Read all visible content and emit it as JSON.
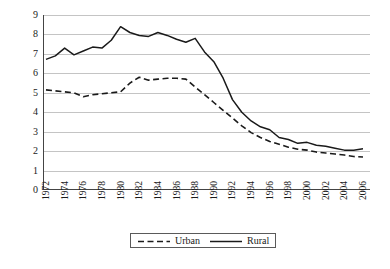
{
  "chart_data": {
    "type": "line",
    "title": "",
    "xlabel": "",
    "ylabel": "Total Fertility Rate",
    "xlim": [
      1972,
      2006
    ],
    "ylim": [
      0,
      9
    ],
    "ytick_labels": [
      "9",
      "8",
      "7",
      "6",
      "5",
      "4",
      "3",
      "2",
      "1",
      "0"
    ],
    "ytick_values": [
      9,
      8,
      7,
      6,
      5,
      4,
      3,
      2,
      1,
      0
    ],
    "xtick_labels": [
      "1972",
      "1974",
      "1976",
      "1978",
      "1980",
      "1982",
      "1984",
      "1986",
      "1988",
      "1990",
      "1992",
      "1994",
      "1996",
      "1998",
      "2000",
      "2002",
      "2004",
      "2006"
    ],
    "xtick_values": [
      1972,
      1974,
      1976,
      1978,
      1980,
      1982,
      1984,
      1986,
      1988,
      1990,
      1992,
      1994,
      1996,
      1998,
      2000,
      2002,
      2004,
      2006
    ],
    "grid": "horizontal",
    "legend_position": "bottom-center",
    "x": [
      1972,
      1973,
      1974,
      1975,
      1976,
      1977,
      1978,
      1979,
      1980,
      1981,
      1982,
      1983,
      1984,
      1985,
      1986,
      1987,
      1988,
      1989,
      1990,
      1991,
      1992,
      1993,
      1994,
      1995,
      1996,
      1997,
      1998,
      1999,
      2000,
      2001,
      2002,
      2003,
      2004,
      2005,
      2006
    ],
    "series": [
      {
        "name": "Urban",
        "style": "dashed",
        "color": "#1a1a1a",
        "values": [
          5.15,
          5.1,
          5.05,
          5.0,
          4.8,
          4.9,
          4.95,
          5.0,
          5.05,
          5.5,
          5.8,
          5.65,
          5.7,
          5.75,
          5.75,
          5.7,
          5.3,
          4.9,
          4.5,
          4.1,
          3.7,
          3.3,
          2.95,
          2.7,
          2.5,
          2.35,
          2.2,
          2.1,
          2.05,
          1.95,
          1.9,
          1.85,
          1.8,
          1.72,
          1.7
        ]
      },
      {
        "name": "Rural",
        "style": "solid",
        "color": "#1a1a1a",
        "values": [
          6.72,
          6.9,
          7.3,
          6.95,
          7.15,
          7.35,
          7.3,
          7.7,
          8.4,
          8.1,
          7.95,
          7.9,
          8.1,
          7.95,
          7.75,
          7.6,
          7.8,
          7.1,
          6.6,
          5.75,
          4.65,
          4.0,
          3.55,
          3.25,
          3.1,
          2.7,
          2.6,
          2.4,
          2.45,
          2.3,
          2.25,
          2.15,
          2.05,
          2.05,
          2.12
        ]
      }
    ]
  },
  "legend": {
    "entries": [
      {
        "label": "Urban",
        "style": "dashed"
      },
      {
        "label": "Rural",
        "style": "solid"
      }
    ]
  }
}
